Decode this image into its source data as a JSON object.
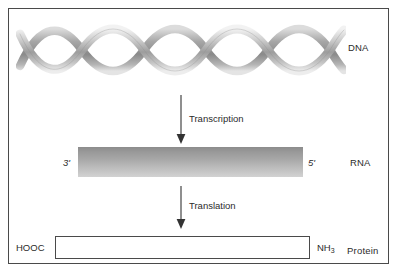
{
  "figure": {
    "background_color": "#ffffff",
    "border_color": "#4a4a4a"
  },
  "rows": {
    "dna": {
      "label": "DNA",
      "graphic": "dna-double-helix",
      "ribbon_color_light": "#e8e8e8",
      "ribbon_color_dark": "#8f8f8f"
    },
    "rna": {
      "label": "RNA",
      "left_end": "3'",
      "right_end": "5'",
      "bar_color_top": "#8c8c8c",
      "bar_color_bottom": "#d2d2d2"
    },
    "protein": {
      "label": "Protein",
      "left_terminus": "HOOC",
      "right_terminus_text": "NH",
      "right_terminus_subscript": "3",
      "box_fill": "#ffffff"
    }
  },
  "arrows": [
    {
      "name": "transcription",
      "caption": "Transcription",
      "direction": "down",
      "color": "#333333"
    },
    {
      "name": "translation",
      "caption": "Translation",
      "direction": "down",
      "color": "#333333"
    }
  ]
}
